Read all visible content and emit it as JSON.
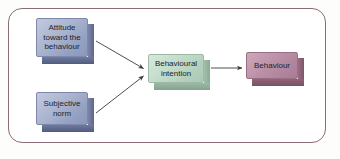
{
  "diagram": {
    "border_color": "#8b6b74",
    "background": "#ffffff",
    "nodes": [
      {
        "id": "attitude",
        "label": "Attitude toward the behaviour",
        "lines": [
          "Attitude",
          "toward the",
          "behaviour"
        ],
        "color": "#abb5d0",
        "style": "3d-box-blue"
      },
      {
        "id": "subjective-norm",
        "label": "Subjective norm",
        "lines": [
          "Subjective",
          "norm"
        ],
        "color": "#abb5d0",
        "style": "3d-box-blue"
      },
      {
        "id": "behavioural-intention",
        "label": "Behavioural intention",
        "lines": [
          "Behavioural",
          "intention"
        ],
        "color": "#c2dbc9",
        "style": "3d-box-green"
      },
      {
        "id": "behaviour",
        "label": "Behaviour",
        "lines": [
          "Behaviour"
        ],
        "color": "#bd93a9",
        "style": "3d-box-mauve"
      }
    ],
    "edges": [
      {
        "id": "attitude-to-intention",
        "from": "attitude",
        "to": "behavioural-intention",
        "arrow": "single"
      },
      {
        "id": "norm-to-intention",
        "from": "subjective-norm",
        "to": "behavioural-intention",
        "arrow": "single"
      },
      {
        "id": "intention-to-behaviour",
        "from": "behavioural-intention",
        "to": "behaviour",
        "arrow": "single"
      }
    ],
    "arrow_color": "#3a3a3a"
  }
}
